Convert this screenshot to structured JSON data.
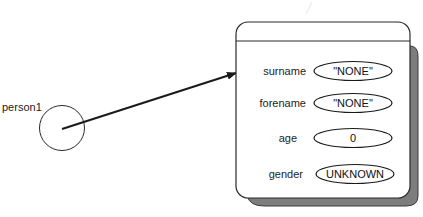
{
  "diagram": {
    "reference": {
      "name": "person1"
    },
    "object": {
      "fields": [
        {
          "name": "surname",
          "value": "\"NONE\""
        },
        {
          "name": "forename",
          "value": "\"NONE\""
        },
        {
          "name": "age",
          "value": "0"
        },
        {
          "name": "gender",
          "value": "UNKNOWN"
        }
      ]
    },
    "colors": {
      "stroke": "#2a2a2a",
      "shadow": "#7a7a7a",
      "background": "#ffffff"
    }
  }
}
